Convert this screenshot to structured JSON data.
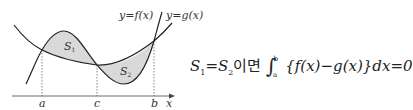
{
  "diagram": {
    "curve_f_label": "y=f(x)",
    "curve_g_label": "y=g(x)",
    "region_1_label": "S",
    "region_1_sub": "1",
    "region_2_label": "S",
    "region_2_sub": "2",
    "x_axis_label": "x",
    "tick_a": "a",
    "tick_c": "c",
    "tick_b": "b",
    "fill_color": "#d9d9d9",
    "line_color": "#222222"
  },
  "formula": {
    "lhs": "S",
    "sub1": "1",
    "eq": "=S",
    "sub2": "2",
    "connector": "이면",
    "upper": "b",
    "lower": "a",
    "integrand": "{f(x)−g(x)}dx=0"
  }
}
